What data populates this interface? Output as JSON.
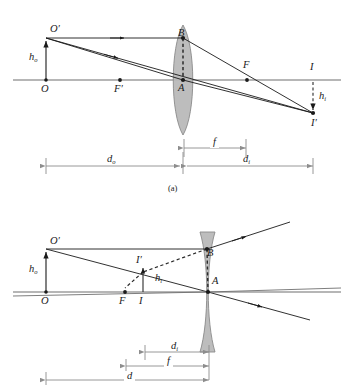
{
  "figure": {
    "kind": "optics-ray-diagram",
    "panels": [
      {
        "id": "a",
        "caption": "(a)",
        "lens_type": "converging-convex",
        "labels": {
          "object_top": "O",
          "object_top_prime": "′",
          "object_height": "h",
          "object_height_sub": "o",
          "object_base": "O",
          "focal_near": "F",
          "focal_near_prime": "′",
          "focal_far": "F",
          "lens_center": "A",
          "lens_top_ray_point": "B",
          "image_base": "I",
          "image_tip": "I",
          "image_tip_prime": "′",
          "image_height": "h",
          "image_height_sub": "i",
          "dim_object_distance": "d",
          "dim_object_distance_sub": "o",
          "dim_focal_length": "f",
          "dim_image_distance": "d",
          "dim_image_distance_sub": "i"
        }
      },
      {
        "id": "b",
        "caption": "",
        "lens_type": "diverging-concave",
        "labels": {
          "object_top": "O",
          "object_top_prime": "′",
          "object_height": "h",
          "object_height_sub": "o",
          "object_base": "O",
          "focal_near": "F",
          "lens_center": "A",
          "lens_top_ray_point": "B",
          "image_base": "I",
          "image_tip": "I",
          "image_tip_prime": "′",
          "image_height": "h",
          "image_height_sub": "i",
          "dim_image_distance": "d",
          "dim_image_distance_sub": "i",
          "dim_focal_length": "f",
          "dim_object_distance": "d"
        }
      }
    ],
    "colors": {
      "ink": "#1a1a1a",
      "axis": "#6f6f6f",
      "lens_fill": "#b9b9b9",
      "lens_stroke": "#8a8a8a",
      "dim_line": "#8d8d8d",
      "dashed": "#2b2b2b"
    }
  }
}
